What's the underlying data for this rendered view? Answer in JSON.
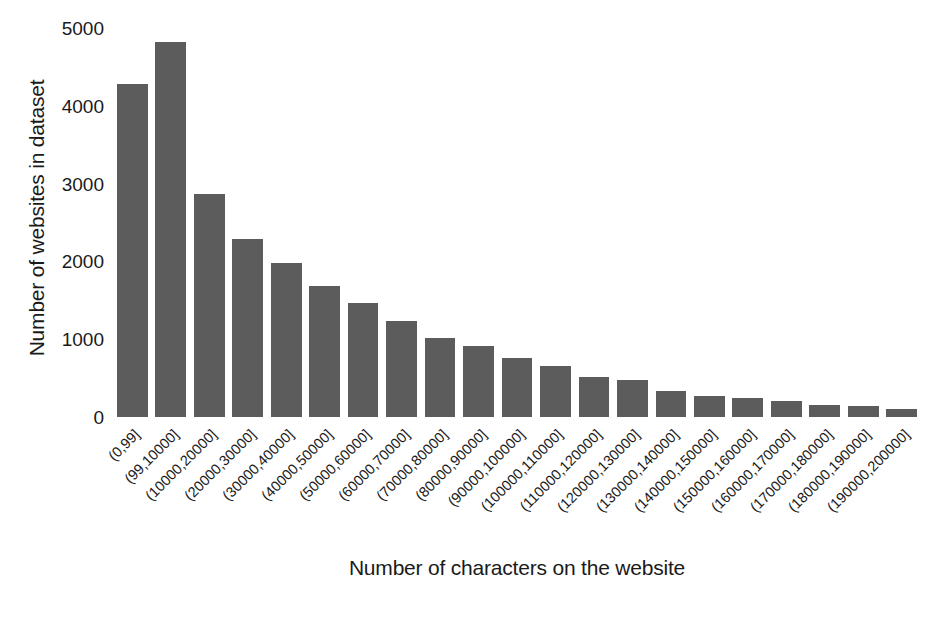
{
  "chart_data": {
    "type": "bar",
    "title": "",
    "xlabel": "Number of characters on the website",
    "ylabel": "Number of websites in dataset",
    "ylim": [
      0,
      5000
    ],
    "yticks": [
      0,
      1000,
      2000,
      3000,
      4000,
      5000
    ],
    "ytick_labels": [
      "0",
      "1000",
      "2000",
      "3000",
      "4000",
      "5000"
    ],
    "grid": false,
    "legend": "none",
    "bar_color": "#5c5c5c",
    "background_color": "#ffffff",
    "categories": [
      "(0,99]",
      "(99,10000]",
      "(10000,20000]",
      "(20000,30000]",
      "(30000,40000]",
      "(40000,50000]",
      "(50000,60000]",
      "(60000,70000]",
      "(70000,80000]",
      "(80000,90000]",
      "(90000,100000]",
      "(100000,110000]",
      "(110000,120000]",
      "(120000,130000]",
      "(130000,140000]",
      "(140000,150000]",
      "(150000,160000]",
      "(160000,170000]",
      "(170000,180000]",
      "(180000,190000]",
      "(190000,200000]"
    ],
    "values": [
      4280,
      4820,
      2870,
      2290,
      1980,
      1690,
      1460,
      1240,
      1010,
      910,
      760,
      650,
      520,
      470,
      340,
      270,
      250,
      200,
      155,
      145,
      100
    ]
  }
}
